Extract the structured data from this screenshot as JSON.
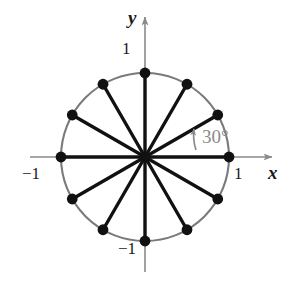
{
  "figure": {
    "axes": {
      "x_label": "x",
      "y_label": "y",
      "x_tick_positive": "1",
      "x_tick_negative": "−1",
      "y_tick_positive": "1",
      "y_tick_negative": "−1"
    },
    "annotation": {
      "angle_text": "30°",
      "arrow_name": "angle-arc-arrow"
    },
    "colors": {
      "axis": "#8a8a8a",
      "circle": "#7a7a7a",
      "radius": "#111111",
      "point": "#111111",
      "label": "#1a1a1a",
      "annotation": "#8a8a8a",
      "background": "#ffffff"
    }
  },
  "chart_data": {
    "type": "scatter",
    "title": "",
    "xlabel": "x",
    "ylabel": "y",
    "xlim": [
      -1.55,
      1.7
    ],
    "ylim": [
      -1.55,
      1.8
    ],
    "grid": false,
    "legend": null,
    "circle": {
      "center": [
        0,
        0
      ],
      "radius": 1,
      "label": "unit circle"
    },
    "angle_step_degrees": 30,
    "point_count": 12,
    "annotations": [
      {
        "text": "30°",
        "at_degrees": 15,
        "description": "arc arrow spanning from 0° to 30°"
      }
    ],
    "xticks": [
      -1,
      1
    ],
    "xticklabels": [
      "−1",
      "1"
    ],
    "yticks": [
      -1,
      1
    ],
    "yticklabels": [
      "−1",
      "1"
    ],
    "points": [
      {
        "angle_deg": 0,
        "x": 1.0,
        "y": 0.0
      },
      {
        "angle_deg": 30,
        "x": 0.86603,
        "y": 0.5
      },
      {
        "angle_deg": 60,
        "x": 0.5,
        "y": 0.86603
      },
      {
        "angle_deg": 90,
        "x": 0.0,
        "y": 1.0
      },
      {
        "angle_deg": 120,
        "x": -0.5,
        "y": 0.86603
      },
      {
        "angle_deg": 150,
        "x": -0.86603,
        "y": 0.5
      },
      {
        "angle_deg": 180,
        "x": -1.0,
        "y": 0.0
      },
      {
        "angle_deg": 210,
        "x": -0.86603,
        "y": -0.5
      },
      {
        "angle_deg": 240,
        "x": -0.5,
        "y": -0.86603
      },
      {
        "angle_deg": 270,
        "x": 0.0,
        "y": -1.0
      },
      {
        "angle_deg": 300,
        "x": 0.5,
        "y": -0.86603
      },
      {
        "angle_deg": 330,
        "x": 0.86603,
        "y": -0.5
      }
    ]
  }
}
